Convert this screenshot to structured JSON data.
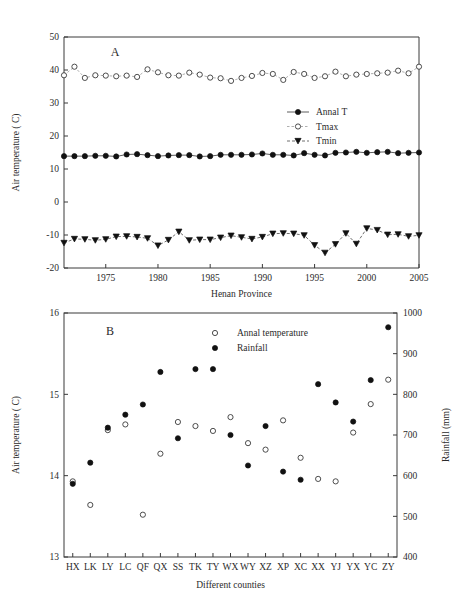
{
  "figure": {
    "panel_a_label": "A",
    "panel_b_label": "B"
  },
  "chart_data": [
    {
      "type": "line",
      "panel": "A",
      "title": "",
      "xlabel": "Henan Province",
      "ylabel": "Air temperature ( C)",
      "xlim": [
        1971,
        2005
      ],
      "ylim": [
        -20,
        50
      ],
      "yticks": [
        -20,
        -10,
        0,
        10,
        20,
        30,
        40,
        50
      ],
      "xticks": [
        1975,
        1980,
        1985,
        1990,
        1995,
        2000,
        2005
      ],
      "grid": false,
      "legend_position": "right-middle",
      "x": [
        1971,
        1972,
        1973,
        1974,
        1975,
        1976,
        1977,
        1978,
        1979,
        1980,
        1981,
        1982,
        1983,
        1984,
        1985,
        1986,
        1987,
        1988,
        1989,
        1990,
        1991,
        1992,
        1993,
        1994,
        1995,
        1996,
        1997,
        1998,
        1999,
        2000,
        2001,
        2002,
        2003,
        2004,
        2005
      ],
      "series": [
        {
          "name": "Annal T",
          "marker": "filled-circle",
          "linestyle": "solid",
          "values": [
            13.9,
            13.9,
            13.9,
            14.0,
            14.0,
            13.8,
            14.4,
            14.5,
            14.2,
            13.9,
            14.1,
            14.2,
            14.2,
            13.8,
            13.9,
            14.3,
            14.3,
            14.3,
            14.4,
            14.7,
            14.3,
            14.3,
            14.1,
            14.8,
            14.3,
            14.1,
            14.9,
            15.0,
            15.2,
            14.9,
            15.1,
            15.2,
            14.8,
            14.9,
            15.0
          ]
        },
        {
          "name": "Tmax",
          "marker": "open-circle",
          "linestyle": "dotted",
          "values": [
            38.4,
            41.0,
            37.6,
            38.4,
            38.3,
            38.1,
            38.3,
            37.9,
            40.2,
            39.3,
            38.4,
            38.3,
            39.2,
            38.6,
            37.7,
            37.5,
            36.7,
            37.6,
            38.2,
            39.1,
            38.8,
            37.0,
            39.4,
            38.8,
            37.6,
            38.1,
            39.5,
            38.1,
            38.6,
            38.8,
            39.0,
            39.2,
            39.8,
            39.0,
            41.0
          ]
        },
        {
          "name": "Tmin",
          "marker": "filled-triangle-down",
          "linestyle": "dashed",
          "values": [
            -12.4,
            -11.2,
            -11.3,
            -11.6,
            -11.3,
            -10.5,
            -10.4,
            -10.6,
            -11.0,
            -13.2,
            -11.5,
            -9.0,
            -11.6,
            -11.4,
            -11.4,
            -10.8,
            -10.2,
            -10.7,
            -11.2,
            -10.6,
            -9.6,
            -9.5,
            -9.6,
            -10.1,
            -13.1,
            -15.4,
            -12.8,
            -9.5,
            -12.7,
            -8.0,
            -8.5,
            -9.9,
            -9.8,
            -10.4,
            -10.1
          ]
        }
      ]
    },
    {
      "type": "scatter",
      "panel": "B",
      "title": "",
      "xlabel": "Different counties",
      "ylabel": "Air temperature ( C)",
      "y2label": "Rainfall (mm)",
      "ylim": [
        13,
        16
      ],
      "yticks": [
        13,
        14,
        15,
        16
      ],
      "y2lim": [
        400,
        1000
      ],
      "y2ticks": [
        400,
        500,
        600,
        700,
        800,
        900,
        1000
      ],
      "grid": false,
      "legend_position": "top-center",
      "categories": [
        "HX",
        "LK",
        "LY",
        "LC",
        "QF",
        "QX",
        "SS",
        "TK",
        "TY",
        "WX",
        "WY",
        "XZ",
        "XP",
        "XC",
        "XX",
        "YJ",
        "YX",
        "YC",
        "ZY"
      ],
      "series": [
        {
          "name": "Annal temperature",
          "marker": "open-circle",
          "axis": "left",
          "values": [
            13.93,
            13.64,
            14.56,
            14.63,
            13.52,
            14.27,
            14.66,
            14.61,
            14.55,
            14.72,
            14.4,
            14.32,
            14.68,
            14.22,
            13.96,
            13.93,
            14.53,
            14.88,
            15.18
          ]
        },
        {
          "name": "Rainfall",
          "marker": "filled-circle",
          "axis": "right",
          "values": [
            580,
            632,
            718,
            750,
            775,
            855,
            692,
            862,
            862,
            700,
            625,
            722,
            610,
            590,
            825,
            780,
            733,
            835,
            965
          ]
        }
      ]
    }
  ]
}
